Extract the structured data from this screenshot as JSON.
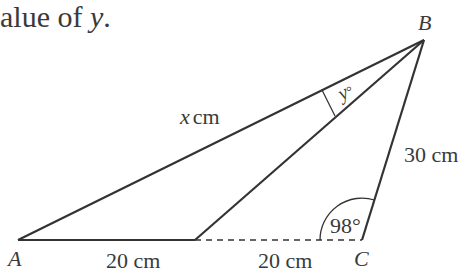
{
  "question": {
    "text_fragment": "alue of ",
    "variable": "y",
    "end": "."
  },
  "vertices": {
    "A": "A",
    "B": "B",
    "C": "C"
  },
  "labels": {
    "AB_var": "x",
    "AB_unit": "cm",
    "BC": "30 cm",
    "AD": "20 cm",
    "DC": "20 cm",
    "angle_C": "98°",
    "angle_y_var": "y",
    "angle_y_deg": "°"
  },
  "colors": {
    "line": "#333333",
    "text": "#3a3a3a"
  },
  "geometry": {
    "A": [
      18,
      240
    ],
    "D": [
      195,
      240
    ],
    "C": [
      362,
      240
    ],
    "B": [
      424,
      40
    ]
  }
}
